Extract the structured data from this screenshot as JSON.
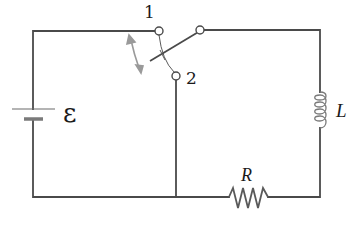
{
  "diagram": {
    "type": "RL circuit with two-position switch",
    "colors": {
      "wire": "#4a4a4a",
      "component_gray": "#7a7a7a",
      "arrow": "#9a9a9a",
      "text": "#1a1a1a",
      "background": "#ffffff"
    },
    "labels": {
      "emf": "ε",
      "switch_pos_1": "1",
      "switch_pos_2": "2",
      "inductor": "L",
      "resistor": "R"
    },
    "components": [
      {
        "name": "battery",
        "symbol": "emf-source",
        "label": "ε"
      },
      {
        "name": "switch",
        "symbol": "SPDT switch",
        "positions": [
          "1",
          "2"
        ]
      },
      {
        "name": "inductor",
        "symbol": "coil",
        "label": "L"
      },
      {
        "name": "resistor",
        "symbol": "zigzag",
        "label": "R"
      }
    ]
  }
}
